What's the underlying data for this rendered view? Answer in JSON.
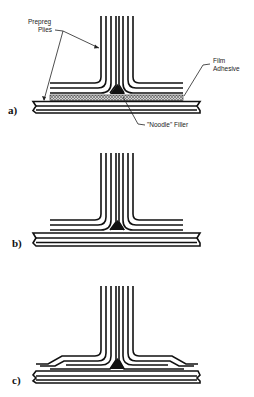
{
  "figure": {
    "panels": [
      {
        "id": "a",
        "label": "a)"
      },
      {
        "id": "b",
        "label": "b)"
      },
      {
        "id": "c",
        "label": "c)"
      }
    ],
    "callouts": {
      "prepreg_line1": "Prepreg",
      "prepreg_line2": "Plies",
      "film_line1": "Film",
      "film_line2": "Adhesive",
      "noodle": "\"Noodle\"  Filler"
    },
    "colors": {
      "ink": "#111111",
      "background": "#ffffff",
      "adhesive_fill": "#9a9a9a"
    }
  }
}
